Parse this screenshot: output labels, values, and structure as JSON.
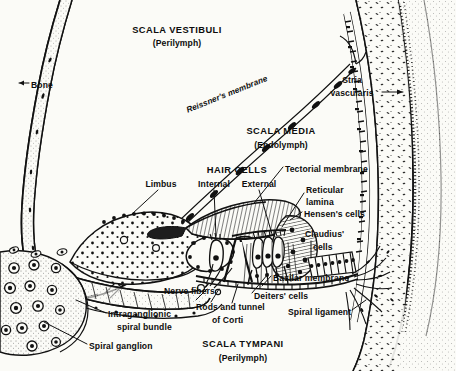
{
  "figure": {
    "width": 456,
    "height": 371,
    "background_color": "#fbfbf7",
    "ink_color": "#0d0d0d"
  },
  "labels": {
    "scala_vestibuli": {
      "text": "SCALA VESTIBULI",
      "x": 177,
      "y": 30,
      "align": "center",
      "style": "big"
    },
    "scala_vestibuli_fluid": {
      "text": "(Perilymph)",
      "x": 177,
      "y": 43,
      "align": "center",
      "style": "sub"
    },
    "bone": {
      "text": "Bone",
      "x": 31,
      "y": 86,
      "align": "left",
      "style": "sub"
    },
    "reissners_membrane": {
      "text": "Reissner's membrane",
      "x": 187,
      "y": 112,
      "align": "left",
      "style": "rot",
      "rotation": -22
    },
    "stria_vascularis_line1": {
      "text": "Stria",
      "x": 352,
      "y": 81,
      "align": "center",
      "style": "sub"
    },
    "stria_vascularis_line2": {
      "text": "vascularis",
      "x": 352,
      "y": 95,
      "align": "center",
      "style": "sub"
    },
    "scala_media": {
      "text": "SCALA MEDIA",
      "x": 281,
      "y": 131,
      "align": "center",
      "style": "big"
    },
    "scala_media_fluid": {
      "text": "(Endolymph)",
      "x": 281,
      "y": 145,
      "align": "center",
      "style": "sub"
    },
    "hair_cells": {
      "text": "HAIR CELLS",
      "x": 237,
      "y": 170,
      "align": "center",
      "style": "big"
    },
    "hair_cells_internal": {
      "text": "Internal",
      "x": 214,
      "y": 185,
      "align": "center",
      "style": "sub"
    },
    "hair_cells_external": {
      "text": "External",
      "x": 259,
      "y": 185,
      "align": "center",
      "style": "sub"
    },
    "limbus": {
      "text": "Limbus",
      "x": 161,
      "y": 185,
      "align": "center",
      "style": "sub"
    },
    "tectorial_membrane": {
      "text": "Tectorial membrane",
      "x": 285,
      "y": 170,
      "align": "left",
      "style": "sub"
    },
    "reticular_lamina_line1": {
      "text": "Reticular",
      "x": 306,
      "y": 191,
      "align": "left",
      "style": "sub"
    },
    "reticular_lamina_line2": {
      "text": "lamina",
      "x": 306,
      "y": 203,
      "align": "left",
      "style": "sub"
    },
    "hensens_cells": {
      "text": "Hensen's cells",
      "x": 304,
      "y": 215,
      "align": "left",
      "style": "sub"
    },
    "claudius_cells_line1": {
      "text": "Claudius'",
      "x": 305,
      "y": 235,
      "align": "left",
      "style": "sub"
    },
    "claudius_cells_line2": {
      "text": "cells",
      "x": 313,
      "y": 248,
      "align": "left",
      "style": "sub"
    },
    "basilar_membrane": {
      "text": "Basilar membrane",
      "x": 273,
      "y": 279,
      "align": "left",
      "style": "sub"
    },
    "deiters_cells": {
      "text": "Deiters' cells",
      "x": 254,
      "y": 297,
      "align": "left",
      "style": "sub"
    },
    "spiral_ligament": {
      "text": "Spiral ligament",
      "x": 288,
      "y": 313,
      "align": "left",
      "style": "sub"
    },
    "nerve_fibers": {
      "text": "Nerve fibers",
      "x": 164,
      "y": 292,
      "align": "left",
      "style": "sub"
    },
    "rods_and_tunnel_line1": {
      "text": "Rods and tunnel",
      "x": 196,
      "y": 308,
      "align": "left",
      "style": "sub"
    },
    "rods_and_tunnel_line2": {
      "text": "of Corti",
      "x": 212,
      "y": 321,
      "align": "left",
      "style": "sub"
    },
    "intraganglionic_line1": {
      "text": "Intraganglionic",
      "x": 108,
      "y": 315,
      "align": "left",
      "style": "sub"
    },
    "intraganglionic_line2": {
      "text": "spiral bundle",
      "x": 117,
      "y": 328,
      "align": "left",
      "style": "sub"
    },
    "spiral_ganglion": {
      "text": "Spiral ganglion",
      "x": 89,
      "y": 347,
      "align": "left",
      "style": "sub"
    },
    "scala_tympani": {
      "text": "SCALA TYMPANI",
      "x": 243,
      "y": 345,
      "align": "center",
      "style": "big"
    },
    "scala_tympani_fluid": {
      "text": "(Perilymph)",
      "x": 243,
      "y": 359,
      "align": "center",
      "style": "sub"
    }
  }
}
